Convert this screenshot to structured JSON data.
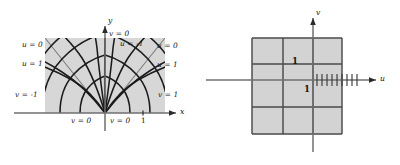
{
  "figure": {
    "kind": "conformal-mapping-figure",
    "colors": {
      "region_fill_left": "#d7d7d7",
      "region_fill_right": "#d3d3d3",
      "curve_dark": "#1b1b1b",
      "curve_mid": "#555555",
      "axis": "#6f6f6f",
      "grid": "#4a4a4a",
      "text": "#141414",
      "background": "#ffffff"
    }
  },
  "left_panel": {
    "name": "z-plane",
    "axes": {
      "x_label": "x",
      "y_label": "y"
    },
    "labels": [
      {
        "id": "u0-left",
        "text": "u = 0",
        "x": 22,
        "y": 44
      },
      {
        "id": "u1-left",
        "text": "u = 1",
        "x": 22,
        "y": 63
      },
      {
        "id": "vm1-left",
        "text": "v = -1",
        "x": 16,
        "y": 94
      },
      {
        "id": "v0-top",
        "text": "v = 0",
        "x": 101,
        "y": 32
      },
      {
        "id": "um1-right",
        "text": "u = -1",
        "x": 122,
        "y": 43
      },
      {
        "id": "u0-right",
        "text": "u = 0",
        "x": 158,
        "y": 45
      },
      {
        "id": "u1-right",
        "text": "u = 1",
        "x": 158,
        "y": 64
      },
      {
        "id": "v1-right",
        "text": "v = 1",
        "x": 159,
        "y": 94
      },
      {
        "id": "v0-bottom-left",
        "text": "v = 0",
        "x": 72,
        "y": 120
      },
      {
        "id": "v0-bottom-right",
        "text": "v = 0",
        "x": 104,
        "y": 120
      },
      {
        "id": "tick-one",
        "text": "1",
        "x": 141,
        "y": 119
      }
    ]
  },
  "right_panel": {
    "name": "w-plane",
    "axes": {
      "u_label": "u",
      "v_label": "v"
    },
    "labels": [
      {
        "id": "one-above-axis",
        "text": "1",
        "x": 292,
        "y": 62
      },
      {
        "id": "one-below-axis",
        "text": "1",
        "x": 304,
        "y": 90
      }
    ],
    "grid": {
      "vertical_lines_x": [
        252,
        283,
        313,
        342
      ],
      "horizontal_lines_y": [
        38,
        64,
        107,
        134
      ],
      "axis_u_y": 80,
      "axis_v_x": 313,
      "region_box": {
        "x": 252,
        "y": 38,
        "width": 90,
        "height": 96
      },
      "hatch_tick_count": 9
    }
  }
}
